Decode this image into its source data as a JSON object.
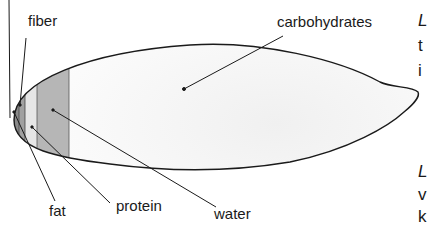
{
  "diagram": {
    "labels": {
      "fiber": "fiber",
      "carbohydrates": "carbohydrates",
      "fat": "fat",
      "protein": "protein",
      "water": "water"
    },
    "bands": [
      {
        "name": "unlabeled-tip",
        "color": "#6e6e6e"
      },
      {
        "name": "fiber",
        "color": "#8a8a8a"
      },
      {
        "name": "fat",
        "color": "#a0a0a0"
      },
      {
        "name": "protein",
        "color": "#e4e4e4"
      },
      {
        "name": "water",
        "color": "#b4b4b4"
      },
      {
        "name": "carbohydrates",
        "color": "#fafafa"
      }
    ],
    "outline_color": "#1a1a1a"
  },
  "side_text": {
    "top": [
      "L",
      "t",
      "i"
    ],
    "bottom": [
      "L",
      "v",
      "k"
    ]
  }
}
